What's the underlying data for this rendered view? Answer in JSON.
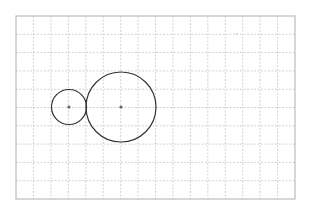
{
  "diagram": {
    "type": "geometry-grid",
    "width": 309,
    "height": 214,
    "grid": {
      "left": 16,
      "top": 16,
      "right": 295,
      "bottom": 199,
      "columns": 16,
      "rows": 10,
      "line_color": "#c8c8c8",
      "border_color": "#bdbdbd",
      "dashed": true
    },
    "circles": [
      {
        "name": "small-circle",
        "cx": 69,
        "cy": 107,
        "r": 17.5,
        "stroke": "#333333",
        "center_color": "#666666"
      },
      {
        "name": "large-circle",
        "cx": 121,
        "cy": 107,
        "r": 35,
        "stroke": "#333333",
        "center_color": "#666666"
      }
    ],
    "marks": [
      {
        "name": "faint-mark",
        "x": 237,
        "y": 34,
        "color": "#cfcfcf"
      }
    ]
  }
}
